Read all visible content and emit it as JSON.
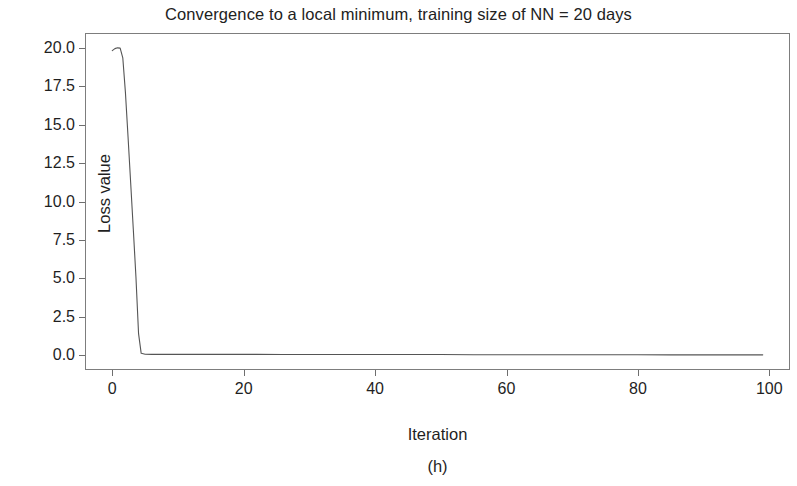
{
  "chart_data": {
    "type": "line",
    "title": "Convergence to a local minimum, training size of NN = 20 days",
    "xlabel": "Iteration",
    "ylabel": "Loss value",
    "caption": "(h)",
    "xlim": [
      -4,
      103
    ],
    "ylim": [
      -0.9,
      20.9
    ],
    "xticks": [
      0,
      20,
      40,
      60,
      80,
      100
    ],
    "xtick_labels": [
      "0",
      "20",
      "40",
      "60",
      "80",
      "100"
    ],
    "yticks": [
      0.0,
      2.5,
      5.0,
      7.5,
      10.0,
      12.5,
      15.0,
      17.5,
      20.0
    ],
    "ytick_labels": [
      "0.0",
      "2.5",
      "5.0",
      "7.5",
      "10.0",
      "12.5",
      "15.0",
      "17.5",
      "20.0"
    ],
    "grid": false,
    "legend": null,
    "line_color": "#555555",
    "series": [
      {
        "name": "Loss value",
        "x": [
          0,
          0.4,
          0.8,
          1.2,
          1.6,
          2,
          2.4,
          2.8,
          3.2,
          3.6,
          4,
          4.4,
          5,
          6,
          8,
          10,
          14,
          18,
          22,
          26,
          30,
          35,
          40,
          45,
          50,
          55,
          60,
          65,
          70,
          75,
          80,
          85,
          90,
          94,
          97,
          99
        ],
        "y": [
          19.82,
          19.95,
          20.0,
          19.98,
          19.35,
          17.1,
          14.2,
          11.2,
          8.2,
          5.1,
          1.4,
          0.12,
          0.06,
          0.05,
          0.05,
          0.05,
          0.05,
          0.05,
          0.05,
          0.04,
          0.04,
          0.04,
          0.04,
          0.04,
          0.04,
          0.03,
          0.03,
          0.03,
          0.03,
          0.03,
          0.03,
          0.02,
          0.02,
          0.02,
          0.02,
          0.02
        ]
      }
    ]
  }
}
